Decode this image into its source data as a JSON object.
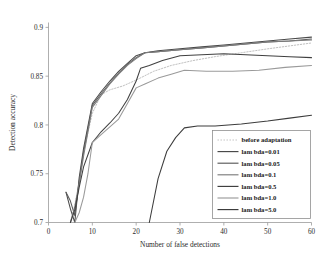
{
  "chart_data": {
    "type": "line",
    "title": "",
    "xlabel": "Number of false detections",
    "ylabel": "Detection accuracy",
    "xlim": [
      0,
      60
    ],
    "ylim": [
      0.7,
      0.905
    ],
    "xticks": [
      0,
      10,
      20,
      30,
      40,
      50,
      60
    ],
    "xticklabels": [
      "0",
      "10",
      "20",
      "30",
      "40",
      "50",
      "60"
    ],
    "yticks": [
      0.7,
      0.75,
      0.8,
      0.85,
      0.9
    ],
    "yticklabels": [
      "0.7",
      "0.75",
      "0.8",
      "0.85",
      "0.9"
    ],
    "grid": false,
    "legend_position": "lower right",
    "series": [
      {
        "name": "before adaptation",
        "style": "dotted",
        "color": "#b0b0b0",
        "points": [
          [
            5,
            0.7
          ],
          [
            6,
            0.718
          ],
          [
            7,
            0.742
          ],
          [
            8,
            0.772
          ],
          [
            10,
            0.812
          ],
          [
            12,
            0.831
          ],
          [
            14,
            0.836
          ],
          [
            17,
            0.84
          ],
          [
            20,
            0.846
          ],
          [
            24,
            0.855
          ],
          [
            28,
            0.861
          ],
          [
            33,
            0.866
          ],
          [
            38,
            0.87
          ],
          [
            44,
            0.874
          ],
          [
            50,
            0.878
          ],
          [
            55,
            0.881
          ],
          [
            60,
            0.884
          ]
        ]
      },
      {
        "name": "lambda=0.01",
        "style": "solid",
        "color": "#4a4a4a",
        "points": [
          [
            4,
            0.731
          ],
          [
            5,
            0.714
          ],
          [
            6,
            0.7
          ],
          [
            7,
            0.746
          ],
          [
            8,
            0.776
          ],
          [
            10,
            0.822
          ],
          [
            12,
            0.834
          ],
          [
            14,
            0.845
          ],
          [
            16,
            0.855
          ],
          [
            18,
            0.863
          ],
          [
            20,
            0.871
          ],
          [
            22,
            0.874
          ],
          [
            25,
            0.876
          ],
          [
            30,
            0.878
          ],
          [
            35,
            0.88
          ],
          [
            40,
            0.882
          ],
          [
            45,
            0.884
          ],
          [
            50,
            0.886
          ],
          [
            55,
            0.888
          ],
          [
            60,
            0.89
          ]
        ]
      },
      {
        "name": "lambda=0.05",
        "style": "solid",
        "color": "#5a5a5a",
        "points": [
          [
            4,
            0.731
          ],
          [
            5,
            0.722
          ],
          [
            6,
            0.707
          ],
          [
            7,
            0.742
          ],
          [
            8,
            0.772
          ],
          [
            10,
            0.82
          ],
          [
            12,
            0.832
          ],
          [
            14,
            0.843
          ],
          [
            16,
            0.853
          ],
          [
            18,
            0.862
          ],
          [
            20,
            0.869
          ],
          [
            22,
            0.874
          ],
          [
            25,
            0.875
          ],
          [
            30,
            0.877
          ],
          [
            35,
            0.879
          ],
          [
            40,
            0.881
          ],
          [
            45,
            0.883
          ],
          [
            50,
            0.885
          ],
          [
            55,
            0.886
          ],
          [
            60,
            0.888
          ]
        ]
      },
      {
        "name": "lambda=0.1",
        "style": "solid",
        "color": "#7d7d7d",
        "points": [
          [
            5,
            0.7
          ],
          [
            6,
            0.716
          ],
          [
            7,
            0.74
          ],
          [
            8,
            0.768
          ],
          [
            10,
            0.818
          ],
          [
            12,
            0.83
          ],
          [
            14,
            0.842
          ],
          [
            16,
            0.852
          ],
          [
            18,
            0.861
          ],
          [
            20,
            0.868
          ],
          [
            22,
            0.874
          ],
          [
            25,
            0.875
          ],
          [
            30,
            0.877
          ],
          [
            35,
            0.879
          ],
          [
            40,
            0.881
          ],
          [
            45,
            0.883
          ],
          [
            50,
            0.885
          ],
          [
            55,
            0.886
          ],
          [
            60,
            0.887
          ]
        ]
      },
      {
        "name": "lambda=0.5",
        "style": "solid",
        "color": "#404040",
        "points": [
          [
            5,
            0.7
          ],
          [
            6,
            0.713
          ],
          [
            7,
            0.736
          ],
          [
            8,
            0.757
          ],
          [
            10,
            0.782
          ],
          [
            12,
            0.793
          ],
          [
            14,
            0.802
          ],
          [
            16,
            0.812
          ],
          [
            18,
            0.826
          ],
          [
            20,
            0.845
          ],
          [
            21,
            0.858
          ],
          [
            23,
            0.861
          ],
          [
            26,
            0.866
          ],
          [
            30,
            0.871
          ],
          [
            35,
            0.872
          ],
          [
            40,
            0.873
          ],
          [
            45,
            0.872
          ],
          [
            50,
            0.871
          ],
          [
            55,
            0.87
          ],
          [
            60,
            0.869
          ]
        ]
      },
      {
        "name": "lambda=1.0",
        "style": "solid",
        "color": "#9a9a9a",
        "points": [
          [
            6,
            0.7
          ],
          [
            7,
            0.71
          ],
          [
            8,
            0.726
          ],
          [
            9,
            0.75
          ],
          [
            10,
            0.782
          ],
          [
            12,
            0.79
          ],
          [
            14,
            0.798
          ],
          [
            16,
            0.806
          ],
          [
            18,
            0.822
          ],
          [
            20,
            0.838
          ],
          [
            22,
            0.842
          ],
          [
            25,
            0.848
          ],
          [
            28,
            0.852
          ],
          [
            31,
            0.856
          ],
          [
            36,
            0.855
          ],
          [
            42,
            0.855
          ],
          [
            48,
            0.856
          ],
          [
            54,
            0.859
          ],
          [
            60,
            0.861
          ]
        ]
      },
      {
        "name": "lambda=5.0",
        "style": "solid",
        "color": "#3c3c3c",
        "points": [
          [
            23,
            0.7
          ],
          [
            25,
            0.745
          ],
          [
            27,
            0.773
          ],
          [
            29,
            0.787
          ],
          [
            31,
            0.797
          ],
          [
            34,
            0.799
          ],
          [
            38,
            0.799
          ],
          [
            44,
            0.801
          ],
          [
            50,
            0.804
          ],
          [
            55,
            0.807
          ],
          [
            60,
            0.81
          ]
        ]
      }
    ]
  },
  "legend": {
    "entries": [
      {
        "label": "before adaptation",
        "color": "#b0b0b0",
        "style": "dotted"
      },
      {
        "label": "lam bda=0.01",
        "color": "#4a4a4a",
        "style": "solid"
      },
      {
        "label": "lam bda=0.05",
        "color": "#5a5a5a",
        "style": "solid"
      },
      {
        "label": "lam bda=0.1",
        "color": "#7d7d7d",
        "style": "solid"
      },
      {
        "label": "lam bda=0.5",
        "color": "#404040",
        "style": "solid"
      },
      {
        "label": "lam bda=1.0",
        "color": "#9a9a9a",
        "style": "solid"
      },
      {
        "label": "lam bda=5.0",
        "color": "#3c3c3c",
        "style": "solid"
      }
    ]
  }
}
